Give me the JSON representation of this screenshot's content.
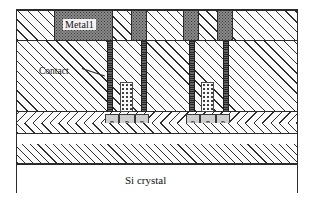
{
  "figure": {
    "background_color": "#ffffff",
    "border_color": "#2b2b2b"
  },
  "labels": {
    "metal": "Metal1",
    "contact": "Contact",
    "substrate": "Si crystal"
  },
  "layers": [
    {
      "name": "metal-1-band",
      "description": "Metal 1 interconnect band with patterned metal blocks in dielectric",
      "fill": "hatched-dielectric + dark-stippled-metal"
    },
    {
      "name": "contact-dielectric",
      "description": "Inter-layer dielectric containing contact vias",
      "fill": "diagonal-hatch"
    },
    {
      "name": "field-oxide",
      "description": "Field oxide / isolation band containing doped regions",
      "fill": "chevron-hatch"
    },
    {
      "name": "epitaxial-layer",
      "description": "Epitaxial silicon layer",
      "fill": "diagonal-hatch"
    },
    {
      "name": "si-crystal",
      "description": "Silicon crystal substrate",
      "fill": "plain-white"
    }
  ],
  "metal_blocks": [
    {
      "id": "metal-block-1",
      "label": "Metal1",
      "has_label": true,
      "x": 37,
      "width": 59
    },
    {
      "id": "metal-block-2",
      "has_label": false,
      "x": 114,
      "width": 16
    },
    {
      "id": "metal-block-3",
      "has_label": false,
      "x": 166,
      "width": 16
    },
    {
      "id": "metal-block-4",
      "has_label": false,
      "x": 200,
      "width": 16
    }
  ],
  "vias": [
    {
      "id": "via-1",
      "x": 90,
      "width": 6
    },
    {
      "id": "via-2",
      "x": 124,
      "width": 6
    },
    {
      "id": "via-3",
      "x": 172,
      "width": 6
    },
    {
      "id": "via-4",
      "x": 206,
      "width": 6
    }
  ],
  "plugs": [
    {
      "id": "plug-left",
      "x": 103,
      "width": 13
    },
    {
      "id": "plug-right",
      "x": 184,
      "width": 13
    }
  ],
  "doping_groups": [
    {
      "id": "doping-group-left",
      "type": "npn",
      "regions": [
        {
          "id": "dope-n1",
          "type": "n",
          "x": 88,
          "width": 14
        },
        {
          "id": "dope-p1",
          "type": "p",
          "x": 102,
          "width": 16
        },
        {
          "id": "dope-n2",
          "type": "n",
          "x": 118,
          "width": 14
        }
      ]
    },
    {
      "id": "doping-group-right",
      "type": "pnp",
      "regions": [
        {
          "id": "dope-p2",
          "type": "p",
          "x": 169,
          "width": 14
        },
        {
          "id": "dope-n3",
          "type": "n",
          "x": 183,
          "width": 16
        },
        {
          "id": "dope-p3",
          "type": "p",
          "x": 199,
          "width": 14
        }
      ]
    }
  ],
  "colors": {
    "outline": "#2b2b2b",
    "metal_fill": "#8a8a8a",
    "via_fill": "#4a4a4a",
    "doping_fill": "#cfcfcf",
    "dielectric_fill": "#fbfbfb",
    "substrate_fill": "#ffffff"
  }
}
